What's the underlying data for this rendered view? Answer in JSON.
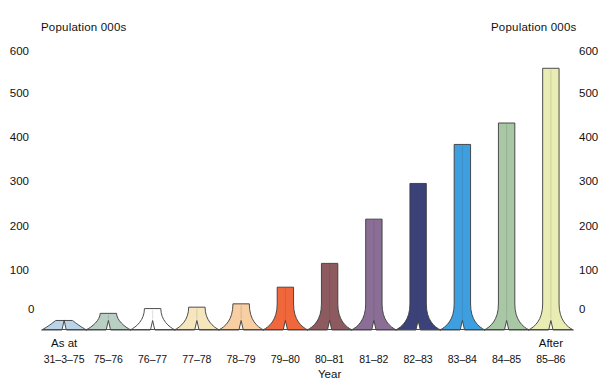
{
  "chart_data": {
    "type": "bar",
    "title": "",
    "ylabel": "Population 000s",
    "ylabel_right": "Population 000s",
    "xlabel": "Year",
    "ylim": [
      0,
      600
    ],
    "yticks": [
      0,
      100,
      200,
      300,
      400,
      500,
      600
    ],
    "ytick_labels": [
      "0",
      "100",
      "200",
      "300",
      "400",
      "500",
      "600"
    ],
    "grid": false,
    "legend": "none",
    "categories": [
      "31–3–75",
      "75–76",
      "76–77",
      "77–78",
      "78–79",
      "79–80",
      "80–81",
      "81–82",
      "82–83",
      "83–84",
      "84–85",
      "85–86"
    ],
    "values": [
      20,
      35,
      45,
      48,
      55,
      90,
      140,
      233,
      308,
      390,
      435,
      550
    ],
    "annotations": [
      {
        "text": "As at",
        "category": "31–3–75"
      },
      {
        "text": "After",
        "category": "85–86"
      }
    ],
    "bar_colors": [
      "#b9d3e8",
      "#b9cfc4",
      "#ffffff",
      "#f6e6bd",
      "#f7cfa3",
      "#f0673c",
      "#8c5a5f",
      "#8a6e96",
      "#3b4279",
      "#3e9fe0",
      "#a8c7a4",
      "#e9edb4"
    ],
    "bar_stroke": "#3a3a3a"
  },
  "axis": {
    "left_title": "Population 000s",
    "right_title": "Population 000s",
    "x_title": "Year",
    "zero_left": "0",
    "zero_right": "0"
  },
  "yticks": {
    "t600": "600",
    "t500": "500",
    "t400": "400",
    "t300": "300",
    "t200": "200",
    "t100": "100"
  },
  "xlabels": {
    "c0": "31–3–75",
    "c1": "75–76",
    "c2": "76–77",
    "c3": "77–78",
    "c4": "78–79",
    "c5": "79–80",
    "c6": "80–81",
    "c7": "81–82",
    "c8": "82–83",
    "c9": "83–84",
    "c10": "84–85",
    "c11": "85–86"
  },
  "notes": {
    "as_at": "As at",
    "after": "After"
  }
}
